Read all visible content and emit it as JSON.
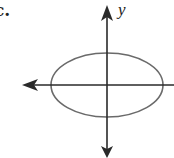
{
  "figure": {
    "choice_label": "c.",
    "y_axis_label": "y"
  },
  "geometry": {
    "origin": {
      "x": 107,
      "y": 85
    },
    "ellipse": {
      "cx": 107,
      "cy": 85,
      "rx": 56,
      "ry": 32
    },
    "x_axis": {
      "x1": 22,
      "x2": 174,
      "y": 85
    },
    "y_axis": {
      "x": 107,
      "y1": 5,
      "y2": 157
    }
  },
  "colors": {
    "axis": "#2a2a2a",
    "ellipse": "#6a6a6a",
    "text": "#222222"
  }
}
